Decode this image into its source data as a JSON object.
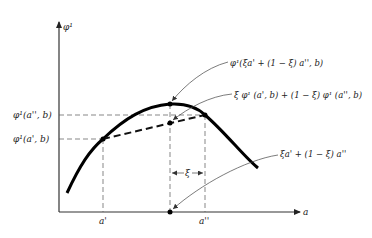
{
  "figure": {
    "y_axis_label": "φ¹",
    "x_axis_label": "a",
    "y_ticks": {
      "upper": "φ¹(a'', b)",
      "lower": "φ¹(a', b)"
    },
    "x_ticks": {
      "left": "a'",
      "right": "a''"
    },
    "interval_label": "ξ",
    "annotations": {
      "curve_point": "φ¹(ξa' + (1 − ξ) a'', b)",
      "chord_point": "ξ φ¹ (a', b) + (1 − ξ) φ¹ (a'', b)",
      "axis_point": "ξa' + (1 − ξ) a''"
    }
  },
  "colors": {
    "curve": "#000000",
    "guides": "#555555",
    "background": "#ffffff"
  }
}
